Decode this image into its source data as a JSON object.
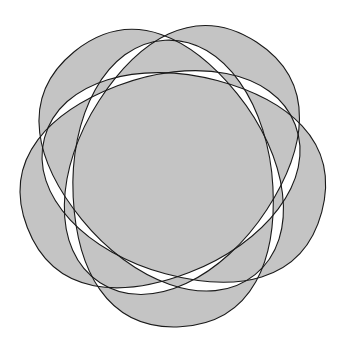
{
  "diagram": {
    "type": "five-set venn diagram",
    "shape_count": 5,
    "center": [
      172,
      172
    ],
    "fill_rule": "evenodd",
    "colors": {
      "background": "#ffffff",
      "fill": "#c4c4c4",
      "stroke": "#1a1a1a"
    },
    "egg": {
      "bulb_x": 155,
      "narrow_x": -132,
      "half_width": 100,
      "widest_x": 20
    },
    "shapes": [
      {
        "name": "shape-right",
        "rotation_deg": 15
      },
      {
        "name": "shape-bottom",
        "rotation_deg": 87
      },
      {
        "name": "shape-left",
        "rotation_deg": 159
      },
      {
        "name": "shape-top-left",
        "rotation_deg": 231
      },
      {
        "name": "shape-top",
        "rotation_deg": 303
      }
    ]
  }
}
